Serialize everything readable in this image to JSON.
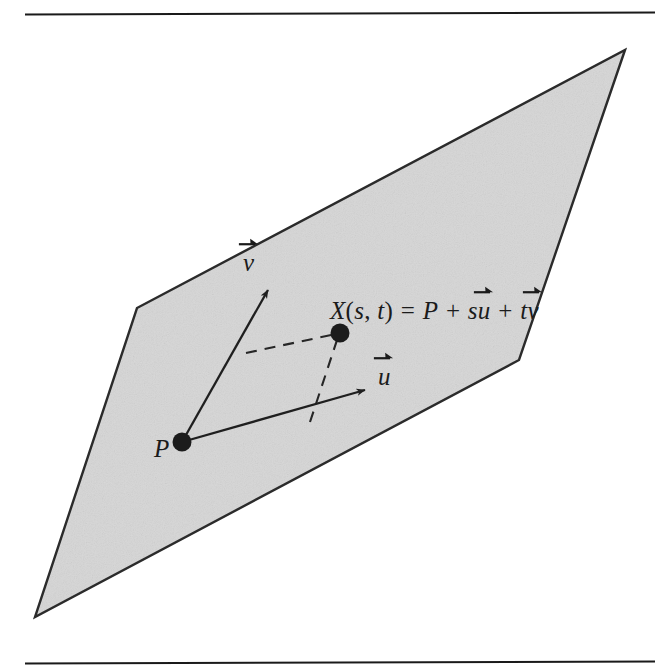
{
  "figure": {
    "caption_text": "",
    "page": {
      "width": 655,
      "height": 670,
      "background_color": "#ffffff"
    },
    "rules": {
      "top_rule_y": 14,
      "bottom_rule_y": 663,
      "rule_start_x": 25,
      "rule_end_x": 655,
      "color": "#1a1a1a"
    },
    "plane": {
      "name": "shaded-plane",
      "fill_color": "#d6d6d6",
      "stroke_color": "#2b2b2b",
      "vertices": [
        {
          "label": "top-right",
          "x": 625,
          "y": 50
        },
        {
          "label": "right",
          "x": 519,
          "y": 360
        },
        {
          "label": "bottom-left",
          "x": 35,
          "y": 617
        },
        {
          "label": "left",
          "x": 137,
          "y": 308
        }
      ]
    },
    "points": [
      {
        "name": "origin-point-p",
        "label": "P",
        "x": 182,
        "y": 442,
        "radius": 9
      },
      {
        "name": "target-point-x",
        "label": "X",
        "x": 340,
        "y": 333,
        "radius": 9
      }
    ],
    "vectors": [
      {
        "name": "vector-v",
        "label": "v",
        "from_x": 182,
        "from_y": 442,
        "to_x": 270,
        "to_y": 287,
        "style": "solid"
      },
      {
        "name": "vector-u",
        "label": "u",
        "from_x": 182,
        "from_y": 442,
        "to_x": 368,
        "to_y": 391,
        "style": "solid"
      }
    ],
    "dashed_lines": [
      {
        "name": "dashed-v-to-x",
        "from_x": 248,
        "from_y": 352,
        "to_x": 340,
        "to_y": 333,
        "style": "dashed"
      },
      {
        "name": "dashed-u-to-x",
        "from_x": 312,
        "from_y": 420,
        "to_x": 340,
        "to_y": 333,
        "style": "dashed"
      }
    ]
  },
  "labels": {
    "point_p": "P",
    "vector_v_glyph": "v",
    "vector_u_glyph": "u",
    "equation": {
      "lhs_function": "X",
      "open_paren": "(",
      "param_s": "s",
      "comma": ", ",
      "param_t": "t",
      "close_paren": ")",
      "equals": " = ",
      "term_point": "P",
      "plus_1": " + ",
      "coef_s": "s",
      "vec_u_glyph": "u",
      "plus_2": " + ",
      "coef_t": "t",
      "vec_v_glyph": "v",
      "full_text": "X(s, t) = P + su⃗ + tv⃗"
    }
  },
  "colors": {
    "ink": "#1b1b1b",
    "plane_fill": "#d6d6d6",
    "plane_stroke": "#2b2b2b",
    "page_background": "#ffffff"
  }
}
